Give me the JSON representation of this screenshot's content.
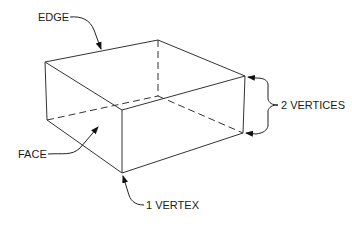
{
  "diagram": {
    "labels": {
      "edge": "EDGE",
      "face": "FACE",
      "vertex_one": "1 VERTEX",
      "vertices_two": "2 VERTICES"
    },
    "colors": {
      "line": "#333333",
      "text": "#1a1a1a",
      "background": "#ffffff"
    }
  }
}
